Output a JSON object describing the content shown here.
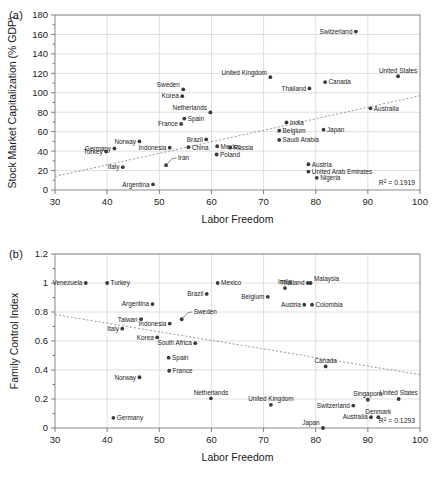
{
  "figure": {
    "panels": [
      {
        "tag": "(a)",
        "chart_data": {
          "type": "scatter",
          "title": "",
          "xlabel": "Labor Freedom",
          "ylabel": "Stock Market Capitalization (% GDP)",
          "xlim": [
            30,
            100
          ],
          "ylim": [
            0,
            180
          ],
          "xticks": [
            30,
            40,
            50,
            60,
            70,
            80,
            90,
            100
          ],
          "yticks": [
            0,
            20,
            40,
            60,
            80,
            100,
            120,
            140,
            160,
            180
          ],
          "grid": true,
          "legend": "none",
          "annotation": "R² = 0.1919",
          "r_squared": 0.1919,
          "trendline": {
            "x0": 30,
            "y0": 14,
            "x1": 100,
            "y1": 97
          },
          "points": [
            {
              "label": "Turkey",
              "x": 39.8,
              "y": 39.5,
              "side": "left"
            },
            {
              "label": "Germany",
              "x": 41.4,
              "y": 42.8,
              "side": "left"
            },
            {
              "label": "Italy",
              "x": 43.0,
              "y": 23.5,
              "side": "left"
            },
            {
              "label": "Norway",
              "x": 46.2,
              "y": 50.0,
              "side": "left"
            },
            {
              "label": "Argentina",
              "x": 48.8,
              "y": 5.8,
              "side": "left"
            },
            {
              "label": "Korea",
              "x": 54.4,
              "y": 96.5,
              "side": "left"
            },
            {
              "label": "Iran",
              "x": 51.3,
              "y": 25.5,
              "side": "leader"
            },
            {
              "label": "Indonesia",
              "x": 52.0,
              "y": 43.5,
              "side": "left"
            },
            {
              "label": "France",
              "x": 54.2,
              "y": 68.0,
              "side": "left"
            },
            {
              "label": "Spain",
              "x": 54.8,
              "y": 73.5,
              "side": "right"
            },
            {
              "label": "Sweden",
              "x": 54.6,
              "y": 103.5,
              "side": "leftup"
            },
            {
              "label": "Brazil",
              "x": 59.0,
              "y": 52.0,
              "side": "left"
            },
            {
              "label": "China",
              "x": 55.6,
              "y": 44.0,
              "side": "right"
            },
            {
              "label": "Netherlands",
              "x": 59.8,
              "y": 79.8,
              "side": "leftup"
            },
            {
              "label": "Mexico",
              "x": 61.1,
              "y": 45.0,
              "side": "right"
            },
            {
              "label": "Poland",
              "x": 61.0,
              "y": 36.5,
              "side": "right"
            },
            {
              "label": "Russia",
              "x": 63.6,
              "y": 43.5,
              "side": "right"
            },
            {
              "label": "United Kingdom",
              "x": 71.3,
              "y": 116.0,
              "side": "leftup"
            },
            {
              "label": "India",
              "x": 74.4,
              "y": 69.5,
              "side": "right"
            },
            {
              "label": "Belgium",
              "x": 73.0,
              "y": 61.0,
              "side": "right"
            },
            {
              "label": "Saudi Arabia",
              "x": 73.0,
              "y": 51.5,
              "side": "right"
            },
            {
              "label": "Thailand",
              "x": 78.8,
              "y": 104.5,
              "side": "left"
            },
            {
              "label": "Austria",
              "x": 78.6,
              "y": 26.5,
              "side": "right"
            },
            {
              "label": "United Arab Emirates",
              "x": 78.6,
              "y": 19.0,
              "side": "right"
            },
            {
              "label": "Nigeria",
              "x": 80.2,
              "y": 12.5,
              "side": "right"
            },
            {
              "label": "Japan",
              "x": 81.5,
              "y": 62.0,
              "side": "right"
            },
            {
              "label": "Canada",
              "x": 81.8,
              "y": 111.0,
              "side": "right"
            },
            {
              "label": "Switzerland",
              "x": 87.7,
              "y": 163.0,
              "side": "left"
            },
            {
              "label": "Australia",
              "x": 90.5,
              "y": 84.0,
              "side": "right"
            },
            {
              "label": "United States",
              "x": 95.8,
              "y": 117.0,
              "side": "midup"
            }
          ]
        }
      },
      {
        "tag": "(b)",
        "chart_data": {
          "type": "scatter",
          "title": "",
          "xlabel": "Labor Freedom",
          "ylabel": "Family Control Index",
          "xlim": [
            30,
            100
          ],
          "ylim": [
            0,
            1.2
          ],
          "xticks": [
            30,
            40,
            50,
            60,
            70,
            80,
            90,
            100
          ],
          "yticks": [
            "0",
            "0.2",
            "0.4",
            "0.6",
            "0.8",
            "1",
            "1.2"
          ],
          "ytickvalues": [
            0,
            0.2,
            0.4,
            0.6,
            0.8,
            1.0,
            1.2
          ],
          "grid": true,
          "legend": "none",
          "annotation": "R² = 0.1293",
          "r_squared": 0.1293,
          "trendline": {
            "x0": 30,
            "y0": 0.782,
            "x1": 100,
            "y1": 0.368
          },
          "points": [
            {
              "label": "Venezuela",
              "x": 35.9,
              "y": 1.0,
              "side": "left"
            },
            {
              "label": "Turkey",
              "x": 40.0,
              "y": 1.0,
              "side": "right"
            },
            {
              "label": "Germany",
              "x": 41.2,
              "y": 0.07,
              "side": "right"
            },
            {
              "label": "Italy",
              "x": 42.9,
              "y": 0.685,
              "side": "left"
            },
            {
              "label": "Norway",
              "x": 46.2,
              "y": 0.35,
              "side": "left"
            },
            {
              "label": "Taiwan",
              "x": 46.5,
              "y": 0.75,
              "side": "left"
            },
            {
              "label": "Argentina",
              "x": 48.7,
              "y": 0.855,
              "side": "left"
            },
            {
              "label": "Korea",
              "x": 49.6,
              "y": 0.625,
              "side": "left"
            },
            {
              "label": "Spain",
              "x": 51.8,
              "y": 0.485,
              "side": "right"
            },
            {
              "label": "France",
              "x": 51.9,
              "y": 0.395,
              "side": "right"
            },
            {
              "label": "Indonesia",
              "x": 52.0,
              "y": 0.72,
              "side": "left"
            },
            {
              "label": "Sweden",
              "x": 54.3,
              "y": 0.75,
              "side": "leader"
            },
            {
              "label": "South Africa",
              "x": 56.9,
              "y": 0.585,
              "side": "left"
            },
            {
              "label": "Brazil",
              "x": 59.1,
              "y": 0.925,
              "side": "left"
            },
            {
              "label": "Netherlands",
              "x": 59.9,
              "y": 0.205,
              "side": "midup"
            },
            {
              "label": "Mexico",
              "x": 61.2,
              "y": 1.0,
              "side": "right"
            },
            {
              "label": "Belgium",
              "x": 70.8,
              "y": 0.905,
              "side": "left"
            },
            {
              "label": "United Kingdom",
              "x": 71.4,
              "y": 0.16,
              "side": "midup"
            },
            {
              "label": "India",
              "x": 74.1,
              "y": 0.965,
              "side": "midup"
            },
            {
              "label": "Thailand",
              "x": 78.5,
              "y": 1.0,
              "side": "left"
            },
            {
              "label": "Malaysia",
              "x": 79.0,
              "y": 1.0,
              "side": "rightup"
            },
            {
              "label": "Austria",
              "x": 77.8,
              "y": 0.85,
              "side": "left"
            },
            {
              "label": "Colombia",
              "x": 79.3,
              "y": 0.85,
              "side": "right"
            },
            {
              "label": "Japan",
              "x": 81.4,
              "y": 0.0,
              "side": "leftup"
            },
            {
              "label": "Canada",
              "x": 81.9,
              "y": 0.425,
              "side": "midup"
            },
            {
              "label": "Switzerland",
              "x": 87.2,
              "y": 0.155,
              "side": "left"
            },
            {
              "label": "Singapore",
              "x": 90.0,
              "y": 0.195,
              "side": "midup"
            },
            {
              "label": "Australia",
              "x": 90.6,
              "y": 0.075,
              "side": "left"
            },
            {
              "label": "Denmark",
              "x": 92.0,
              "y": 0.075,
              "side": "midup"
            },
            {
              "label": "United States",
              "x": 95.9,
              "y": 0.2,
              "side": "midup"
            }
          ]
        }
      }
    ]
  }
}
